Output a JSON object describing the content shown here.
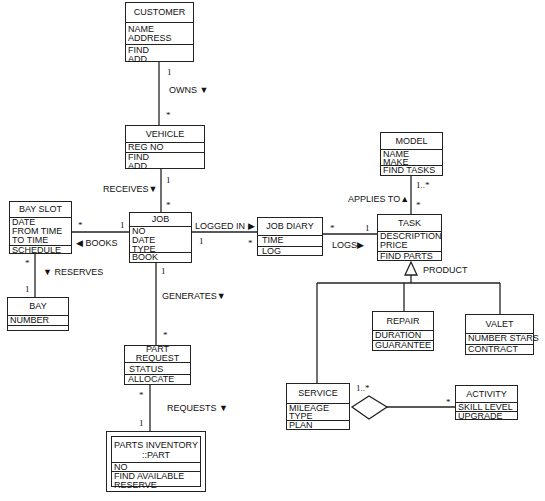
{
  "diagram": {
    "type": "UML class diagram",
    "classes": {
      "customer": {
        "name": "CUSTOMER",
        "attributes": [
          "NAME",
          "ADDRESS"
        ],
        "operations": [
          "FIND",
          "ADD"
        ]
      },
      "vehicle": {
        "name": "VEHICLE",
        "attributes": [
          "REG NO"
        ],
        "operations": [
          "FIND",
          "ADD"
        ]
      },
      "bay_slot": {
        "name": "BAY SLOT",
        "attributes": [
          "DATE",
          "FROM TIME",
          "TO TIME"
        ],
        "operations": [
          "SCHEDULE"
        ]
      },
      "job": {
        "name": "JOB",
        "attributes": [
          "NO",
          "DATE",
          "TYPE"
        ],
        "operations": [
          "BOOK"
        ]
      },
      "job_diary": {
        "name": "JOB DIARY",
        "attributes": [
          "TIME"
        ],
        "operations": [
          "LOG"
        ]
      },
      "model": {
        "name": "MODEL",
        "attributes": [
          "NAME",
          "MAKE"
        ],
        "operations": [
          "FIND TASKS"
        ]
      },
      "task": {
        "name": "TASK",
        "attributes": [
          "DESCRIPTION",
          "PRICE"
        ],
        "operations": [
          "FIND PARTS"
        ]
      },
      "bay": {
        "name": "BAY",
        "attributes": [
          "NUMBER"
        ],
        "operations": []
      },
      "part_request": {
        "name": "PART REQUEST",
        "attributes": [
          "STATUS"
        ],
        "operations": [
          "ALLOCATE"
        ]
      },
      "parts_inventory": {
        "name_line1": "PARTS INVENTORY",
        "name_line2": "::PART",
        "attributes": [
          "NO"
        ],
        "operations": [
          "FIND AVAILABLE",
          "RESERVE"
        ]
      },
      "repair": {
        "name": "REPAIR",
        "attributes": [
          "DURATION"
        ],
        "operations": [
          "GUARANTEE"
        ]
      },
      "valet": {
        "name": "VALET",
        "attributes": [
          "NUMBER STARS"
        ],
        "operations": [
          "CONTRACT"
        ]
      },
      "service": {
        "name": "SERVICE",
        "attributes": [
          "MILEAGE",
          "TYPE"
        ],
        "operations": [
          "PLAN"
        ]
      },
      "activity": {
        "name": "ACTIVITY",
        "attributes": [
          "SKILL LEVEL"
        ],
        "operations": [
          "UPGRADE"
        ]
      }
    },
    "associations": {
      "owns": {
        "label": "OWNS ▼",
        "mult_a": "1",
        "mult_b": "*"
      },
      "receives": {
        "label": "RECEIVES▼",
        "mult_a": "1",
        "mult_b": "*"
      },
      "books": {
        "label": "◀ BOOKS",
        "mult_a": "*",
        "mult_b": "1"
      },
      "reserves": {
        "label": "▼ RESERVES",
        "mult_a": "*",
        "mult_b": "1"
      },
      "logged_in": {
        "label": "LOGGED IN ▶",
        "mult_a": "1",
        "mult_b": "*"
      },
      "logs": {
        "label": "LOGS▶",
        "mult_a": "*",
        "mult_b": "1"
      },
      "applies_to": {
        "label": "APPLIES TO▲",
        "mult_a": "1..*",
        "mult_b": "*"
      },
      "generates": {
        "label": "GENERATES▼",
        "mult_a": "1",
        "mult_b": "*"
      },
      "requests": {
        "label": "REQUESTS ▼",
        "mult_a": "*",
        "mult_b": "1"
      },
      "product": {
        "label": "PRODUCT"
      },
      "service_activity": {
        "mult_a": "1..*",
        "mult_b": "*"
      }
    }
  }
}
